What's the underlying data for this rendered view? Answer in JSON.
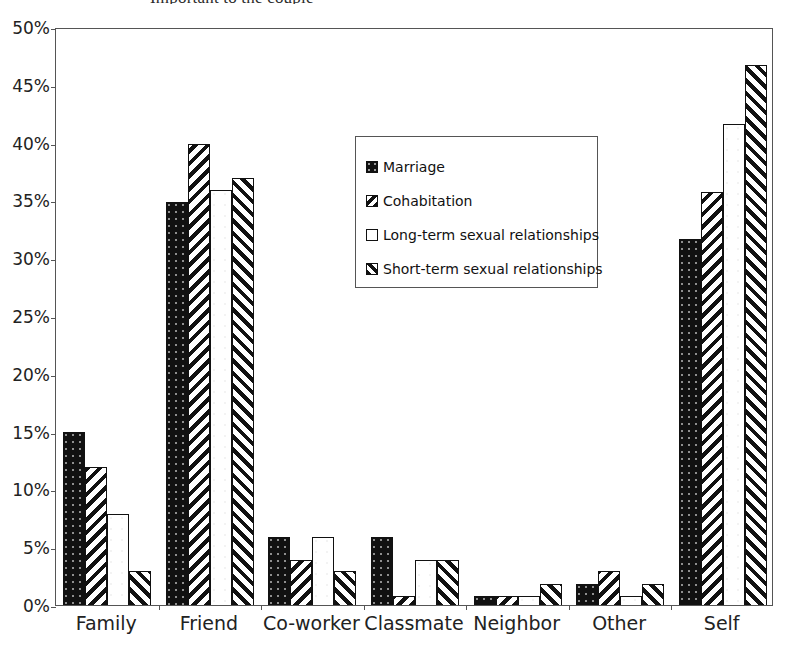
{
  "figure": {
    "clipped_title": "Important to the couple",
    "background_color": "#ffffff",
    "frame_color": "#555555"
  },
  "chart_data": {
    "type": "bar",
    "title": "",
    "xlabel": "",
    "ylabel": "",
    "ylim": [
      0,
      50
    ],
    "ytick_values": [
      0,
      5,
      10,
      15,
      20,
      25,
      30,
      35,
      40,
      45,
      50
    ],
    "ytick_labels": [
      "0%",
      "5%",
      "10%",
      "15%",
      "20%",
      "25%",
      "30%",
      "35%",
      "40%",
      "45%",
      "50%"
    ],
    "grid": false,
    "legend_position": "upper center",
    "categories": [
      "Family",
      "Friend",
      "Co-worker",
      "Classmate",
      "Neighbor",
      "Other",
      "Self"
    ],
    "series": [
      {
        "name": "Marriage",
        "pattern": "solid-black-dotted",
        "color": "#111111",
        "values": [
          15.0,
          34.9,
          5.9,
          5.9,
          0.8,
          1.8,
          31.7
        ]
      },
      {
        "name": "Cohabitation",
        "pattern": "backward-diagonal-hatch",
        "color": "#111111",
        "values": [
          11.9,
          39.9,
          3.9,
          0.8,
          0.8,
          2.9,
          35.7
        ]
      },
      {
        "name": "Long-term sexual relationships",
        "pattern": "white-empty",
        "color": "#ffffff",
        "values": [
          7.9,
          35.9,
          5.9,
          3.9,
          0.8,
          0.8,
          41.6
        ]
      },
      {
        "name": "Short-term sexual relationships",
        "pattern": "forward-diagonal-hatch",
        "color": "#111111",
        "values": [
          2.9,
          36.9,
          2.9,
          3.9,
          1.8,
          1.8,
          46.7
        ]
      }
    ]
  }
}
